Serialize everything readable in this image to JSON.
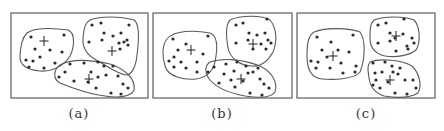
{
  "figure": {
    "panels": [
      {
        "label": "(a)",
        "frame": {
          "x": 11,
          "y": 13,
          "w": 137,
          "h": 85
        },
        "label_x": 79,
        "clusters": [
          {
            "path": "M27,33 C35,27 55,28 68,30 C76,33 74,48 70,56 C64,66 52,72 40,71 C28,70 19,66 20,55 C21,45 22,38 27,33 Z",
            "centroid": [
              44,
              41
            ],
            "points": [
              [
                31,
                37
              ],
              [
                64,
                35
              ],
              [
                35,
                49
              ],
              [
                50,
                50
              ],
              [
                62,
                52
              ],
              [
                40,
                57
              ],
              [
                26,
                60
              ],
              [
                33,
                61
              ],
              [
                55,
                63
              ],
              [
                29,
                67
              ],
              [
                44,
                68
              ]
            ]
          },
          {
            "path": "M90,20 C100,16 120,16 134,20 C140,24 139,40 137,55 C136,66 132,75 126,75 C118,74 110,68 98,61 C88,56 82,49 83,38 C84,28 85,23 90,20 Z",
            "centroid": [
              112,
              51
            ],
            "points": [
              [
                92,
                25
              ],
              [
                101,
                23
              ],
              [
                129,
                25
              ],
              [
                104,
                33
              ],
              [
                113,
                36
              ],
              [
                121,
                33
              ],
              [
                89,
                42
              ],
              [
                102,
                40
              ],
              [
                119,
                43
              ],
              [
                124,
                42
              ],
              [
                127,
                40
              ],
              [
                128,
                45
              ],
              [
                120,
                49
              ]
            ]
          },
          {
            "path": "M60,65 C72,58 92,60 110,64 C125,69 136,79 134,90 C131,97 118,98 105,96 C88,94 72,88 60,83 C54,80 52,71 60,65 Z",
            "centroid": [
              89,
              79
            ],
            "points": [
              [
                70,
                64
              ],
              [
                84,
                63
              ],
              [
                98,
                62
              ],
              [
                104,
                66
              ],
              [
                113,
                66
              ],
              [
                59,
                77
              ],
              [
                65,
                72
              ],
              [
                91,
                72
              ],
              [
                98,
                77
              ],
              [
                106,
                75
              ],
              [
                118,
                76
              ],
              [
                88,
                82
              ],
              [
                96,
                88
              ],
              [
                123,
                84
              ],
              [
                128,
                88
              ],
              [
                111,
                93
              ],
              [
                121,
                94
              ],
              [
                74,
                81
              ]
            ]
          }
        ]
      },
      {
        "label": "(b)",
        "frame": {
          "x": 153,
          "y": 13,
          "w": 139,
          "h": 85
        },
        "label_x": 222,
        "clusters": [
          {
            "path": "M167,39 C174,30 195,30 210,33 C219,36 217,52 215,62 C213,72 205,78 196,79 C184,80 168,77 165,66 C162,56 162,45 167,39 Z",
            "centroid": [
              191,
              50
            ],
            "points": [
              [
                173,
                39
              ],
              [
                208,
                36
              ],
              [
                186,
                44
              ],
              [
                178,
                50
              ],
              [
                203,
                54
              ],
              [
                174,
                57
              ],
              [
                169,
                61
              ],
              [
                181,
                62
              ],
              [
                197,
                62
              ],
              [
                174,
                67
              ],
              [
                186,
                68
              ],
              [
                197,
                72
              ],
              [
                208,
                72
              ]
            ]
          },
          {
            "path": "M230,20 C240,15 263,15 270,20 C276,27 278,40 273,52 C268,61 261,67 252,66 C240,66 230,58 228,48 C226,36 225,25 230,20 Z",
            "centroid": [
              253,
              44
            ],
            "points": [
              [
                236,
                25
              ],
              [
                243,
                23
              ],
              [
                267,
                19
              ],
              [
                249,
                33
              ],
              [
                257,
                35
              ],
              [
                265,
                33
              ],
              [
                236,
                43
              ],
              [
                248,
                40
              ],
              [
                261,
                44
              ],
              [
                268,
                40
              ],
              [
                271,
                43
              ],
              [
                266,
                49
              ],
              [
                253,
                49
              ]
            ]
          },
          {
            "path": "M210,62 C224,57 245,60 260,66 C272,72 278,82 275,92 C271,98 258,98 245,96 C229,93 216,87 210,80 C205,74 204,66 210,62 Z",
            "centroid": [
              241,
              79
            ],
            "points": [
              [
                214,
                67
              ],
              [
                226,
                64
              ],
              [
                237,
                62
              ],
              [
                246,
                66
              ],
              [
                258,
                68
              ],
              [
                224,
                74
              ],
              [
                234,
                71
              ],
              [
                248,
                73
              ],
              [
                253,
                72
              ],
              [
                231,
                80
              ],
              [
                219,
                83
              ],
              [
                235,
                87
              ],
              [
                260,
                79
              ],
              [
                264,
                84
              ],
              [
                269,
                88
              ],
              [
                250,
                93
              ],
              [
                262,
                95
              ],
              [
                243,
                81
              ]
            ]
          }
        ]
      },
      {
        "label": "(c)",
        "frame": {
          "x": 297,
          "y": 13,
          "w": 138,
          "h": 85
        },
        "label_x": 366,
        "clusters": [
          {
            "path": "M314,32 C326,27 350,28 360,32 C366,40 365,60 360,72 C354,79 336,80 322,79 C311,78 307,70 307,56 C307,44 308,36 314,32 Z",
            "centroid": [
              333,
              56
            ],
            "points": [
              [
                317,
                37
              ],
              [
                353,
                35
              ],
              [
                331,
                42
              ],
              [
                322,
                50
              ],
              [
                338,
                50
              ],
              [
                349,
                52
              ],
              [
                311,
                61
              ],
              [
                318,
                62
              ],
              [
                327,
                57
              ],
              [
                341,
                63
              ],
              [
                316,
                68
              ],
              [
                330,
                68
              ],
              [
                343,
                73
              ],
              [
                355,
                72
              ],
              [
                356,
                66
              ]
            ]
          },
          {
            "path": "M374,20 C384,16 404,16 414,20 C420,26 421,42 416,50 C410,55 397,58 385,56 C376,54 370,48 370,38 C370,29 370,24 374,20 Z",
            "centroid": [
              396,
              36
            ],
            "points": [
              [
                378,
                25
              ],
              [
                386,
                23
              ],
              [
                404,
                19
              ],
              [
                390,
                33
              ],
              [
                403,
                34
              ],
              [
                390,
                41
              ],
              [
                378,
                43
              ],
              [
                412,
                38
              ],
              [
                414,
                43
              ],
              [
                407,
                46
              ],
              [
                396,
                51
              ],
              [
                408,
                49
              ],
              [
                395,
                38
              ]
            ]
          },
          {
            "path": "M370,62 C380,58 402,60 412,66 C420,74 422,86 418,93 C410,98 396,98 384,96 C375,93 370,86 369,78 C368,71 367,66 370,62 Z",
            "centroid": [
              390,
              80
            ],
            "points": [
              [
                373,
                63
              ],
              [
                385,
                62
              ],
              [
                392,
                66
              ],
              [
                400,
                68
              ],
              [
                375,
                73
              ],
              [
                382,
                72
              ],
              [
                393,
                72
              ],
              [
                398,
                74
              ],
              [
                376,
                80
              ],
              [
                373,
                85
              ],
              [
                380,
                88
              ],
              [
                405,
                80
              ],
              [
                413,
                80
              ],
              [
                416,
                88
              ],
              [
                395,
                93
              ],
              [
                407,
                94
              ],
              [
                388,
                82
              ]
            ]
          }
        ]
      }
    ]
  }
}
